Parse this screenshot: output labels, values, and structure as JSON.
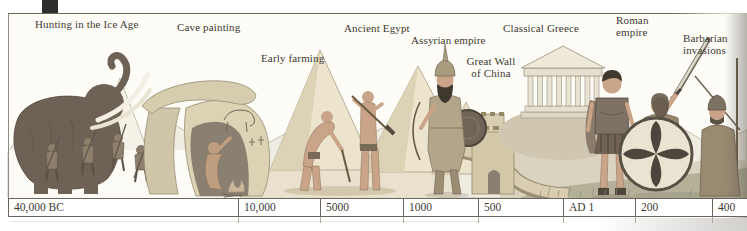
{
  "figure": {
    "description_labels_only": true,
    "palette": {
      "paper": "#fdfcf7",
      "ink": "#3e3a33",
      "line": "#6a655c",
      "tab": "#2e2d2e",
      "rock": "#d6ccae",
      "skin": "#c9a488",
      "mammoth": "#6e6257",
      "grass": "#b0ad93"
    }
  },
  "scene": {
    "labels": [
      {
        "id": "hunting-ice-age",
        "text": "Hunting in the Ice Age",
        "x": 35,
        "y": 18
      },
      {
        "id": "cave-painting",
        "text": "Cave painting",
        "x": 177,
        "y": 21
      },
      {
        "id": "early-farming",
        "text": "Early farming",
        "x": 261,
        "y": 52
      },
      {
        "id": "ancient-egypt",
        "text": "Ancient Egypt",
        "x": 344,
        "y": 22
      },
      {
        "id": "assyrian-empire",
        "text": "Assyrian empire",
        "x": 411,
        "y": 34
      },
      {
        "id": "great-wall-of-china",
        "text": "Great Wall\nof China",
        "x": 491,
        "y": 55,
        "align": "center"
      },
      {
        "id": "classical-greece",
        "text": "Classical Greece",
        "x": 503,
        "y": 22
      },
      {
        "id": "roman-empire",
        "text": "Roman\nempire",
        "x": 616,
        "y": 14
      },
      {
        "id": "barbarian-invasions",
        "text": "Barbarian\ninvasions",
        "x": 683,
        "y": 32
      }
    ]
  },
  "timeline": {
    "unit_note": "years, BC to AD left to right",
    "ticks": [
      {
        "label": "40,000 BC",
        "x": 8
      },
      {
        "label": "10,000",
        "x": 238
      },
      {
        "label": "5000",
        "x": 320
      },
      {
        "label": "1000",
        "x": 403
      },
      {
        "label": "500",
        "x": 478
      },
      {
        "label": "AD 1",
        "x": 563
      },
      {
        "label": "200",
        "x": 635
      },
      {
        "label": "400",
        "x": 712
      }
    ]
  }
}
